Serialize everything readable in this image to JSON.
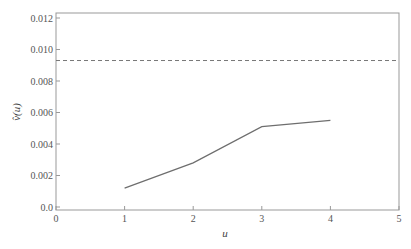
{
  "chart_data": {
    "type": "line",
    "title": "",
    "xlabel": "u",
    "ylabel": "v̂(u)",
    "xlim": [
      0,
      5
    ],
    "ylim": [
      0,
      0.012
    ],
    "x_ticks": [
      "0",
      "1",
      "2",
      "3",
      "4",
      "5"
    ],
    "y_ticks": [
      "0.0",
      "0.002",
      "0.004",
      "0.006",
      "0.008",
      "0.010",
      "0.012"
    ],
    "grid": false,
    "legend": null,
    "series": [
      {
        "name": "v̂(u)",
        "style": "solid",
        "x": [
          1,
          2,
          3,
          4
        ],
        "values": [
          0.0012,
          0.0028,
          0.0051,
          0.0055
        ]
      },
      {
        "name": "reference",
        "style": "dashed",
        "x": [
          0,
          5
        ],
        "values": [
          0.0093,
          0.0093
        ]
      }
    ]
  },
  "colors": {
    "frame": "#888888",
    "line": "#6e6e6e",
    "dashed": "#777777",
    "text": "#555555"
  }
}
